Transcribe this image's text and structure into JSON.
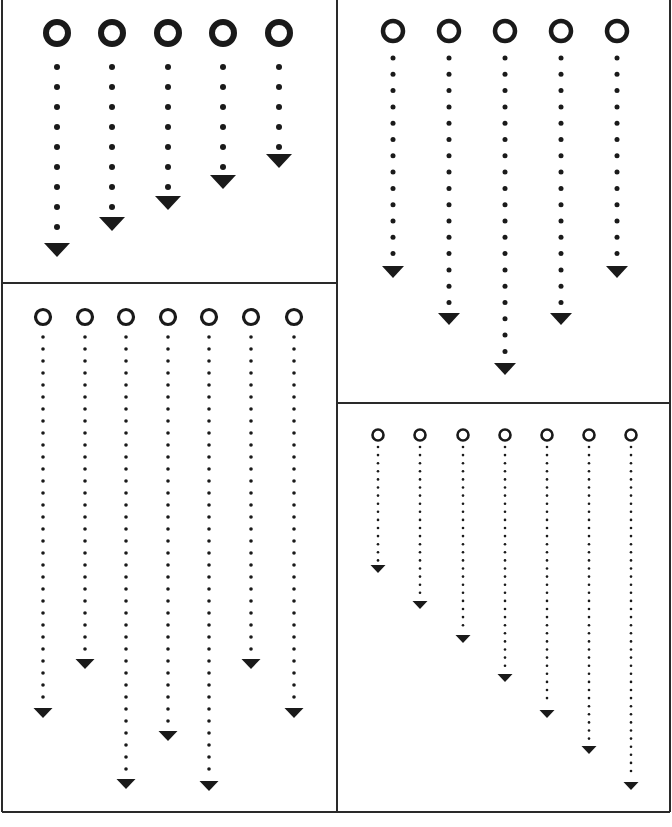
{
  "colors": {
    "ink": "#1a1a1a",
    "background": "#ffffff",
    "border": "#2a2a2a"
  },
  "frame": {
    "left": 2,
    "top": 0,
    "right": 670,
    "bottom": 812,
    "split_x": 337,
    "left_split_y": 283,
    "right_split_y": 403
  },
  "panels": [
    {
      "id": "panel-top-left",
      "ring": {
        "cy": 33,
        "r": 11,
        "stroke": 6
      },
      "dots": {
        "start_y": 67,
        "spacing": 20,
        "r": 3
      },
      "arrow": {
        "w": 26,
        "h": 14
      },
      "columns": [
        {
          "x": 57,
          "dots": 9,
          "arrow_y": 243
        },
        {
          "x": 112,
          "dots": 8,
          "arrow_y": 217
        },
        {
          "x": 168,
          "dots": 7,
          "arrow_y": 196
        },
        {
          "x": 223,
          "dots": 6,
          "arrow_y": 175
        },
        {
          "x": 279,
          "dots": 5,
          "arrow_y": 154
        }
      ]
    },
    {
      "id": "panel-top-right",
      "ring": {
        "cy": 31,
        "r": 10,
        "stroke": 4.5
      },
      "dots": {
        "start_y": 58,
        "spacing": 16.3,
        "r": 2.5
      },
      "arrow": {
        "w": 22,
        "h": 12
      },
      "columns": [
        {
          "x": 393,
          "dots": 13,
          "arrow_y": 266
        },
        {
          "x": 449,
          "dots": 16,
          "arrow_y": 313
        },
        {
          "x": 505,
          "dots": 19,
          "arrow_y": 363
        },
        {
          "x": 561,
          "dots": 16,
          "arrow_y": 313
        },
        {
          "x": 617,
          "dots": 13,
          "arrow_y": 266
        }
      ]
    },
    {
      "id": "panel-bottom-left",
      "ring": {
        "cy": 317,
        "r": 7.5,
        "stroke": 3.2
      },
      "dots": {
        "start_y": 337,
        "spacing": 12,
        "r": 1.8
      },
      "arrow": {
        "w": 19,
        "h": 10
      },
      "columns": [
        {
          "x": 43,
          "dots": 31,
          "arrow_y": 708
        },
        {
          "x": 85,
          "dots": 27,
          "arrow_y": 659
        },
        {
          "x": 126,
          "dots": 37,
          "arrow_y": 779
        },
        {
          "x": 168,
          "dots": 33,
          "arrow_y": 731
        },
        {
          "x": 209,
          "dots": 37,
          "arrow_y": 781
        },
        {
          "x": 251,
          "dots": 27,
          "arrow_y": 659
        },
        {
          "x": 294,
          "dots": 31,
          "arrow_y": 708
        }
      ]
    },
    {
      "id": "panel-bottom-right",
      "ring": {
        "cy": 435,
        "r": 5.5,
        "stroke": 2.6
      },
      "dots": {
        "start_y": 447,
        "spacing": 8.1,
        "r": 1.3
      },
      "arrow": {
        "w": 15,
        "h": 8
      },
      "columns": [
        {
          "x": 378,
          "dots": 15,
          "arrow_y": 565
        },
        {
          "x": 420,
          "dots": 19,
          "arrow_y": 601
        },
        {
          "x": 463,
          "dots": 23,
          "arrow_y": 635
        },
        {
          "x": 505,
          "dots": 28,
          "arrow_y": 674
        },
        {
          "x": 547,
          "dots": 32,
          "arrow_y": 710
        },
        {
          "x": 589,
          "dots": 37,
          "arrow_y": 746
        },
        {
          "x": 631,
          "dots": 41,
          "arrow_y": 782
        }
      ]
    }
  ]
}
